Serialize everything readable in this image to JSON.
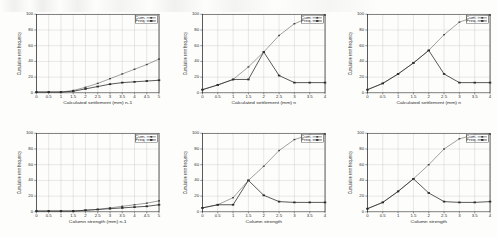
{
  "figure": {
    "background_color": "#fdfdfb",
    "ink_color": "#2b2b2b",
    "grid_color": "#b9b9b9",
    "rows": 2,
    "cols": 3
  },
  "chart_data": [
    {
      "type": "line",
      "panel": "top-left",
      "title": "",
      "xlabel": "Calculated settlement (mm) n-1",
      "ylabel": "Cumulative error frequency",
      "xlim": [
        0,
        5
      ],
      "ylim": [
        0,
        100
      ],
      "grid": true,
      "legend_position": "top-right",
      "xticks": [
        "0",
        "0.5",
        "1",
        "1.5",
        "2",
        "2.5",
        "3",
        "3.5",
        "4",
        "4.5",
        "5"
      ],
      "xtick_labels": [
        "0",
        "0.5",
        "1",
        "1.5",
        "2",
        "2.5",
        "3",
        "3.5",
        "4",
        "4.5",
        "5"
      ],
      "yticks": [
        0,
        20,
        40,
        60,
        80,
        100
      ],
      "ytick_labels": [
        "0",
        "20",
        "40",
        "60",
        "80",
        "100"
      ],
      "series": [
        {
          "name": "Cum.",
          "marker": "square",
          "x": [
            0,
            0.5,
            1,
            1.5,
            2,
            2.5,
            3,
            3.5,
            4,
            4.5,
            5
          ],
          "values": [
            1,
            1,
            1,
            3,
            7,
            12,
            18,
            24,
            30,
            36,
            43
          ]
        },
        {
          "name": "Freq.",
          "marker": "square",
          "x": [
            0,
            0.5,
            1,
            1.5,
            2,
            2.5,
            3,
            3.5,
            4,
            4.5,
            5
          ],
          "values": [
            1,
            1,
            1,
            2,
            5,
            8,
            11,
            13,
            14,
            15,
            16
          ]
        }
      ]
    },
    {
      "type": "line",
      "panel": "top-middle",
      "title": "",
      "xlabel": "Calculated settlement (mm) n",
      "ylabel": "Cumulative error frequency",
      "xlim": [
        0,
        4
      ],
      "ylim": [
        0,
        100
      ],
      "grid": true,
      "legend_position": "top-right",
      "xticks": [
        "0",
        "0.5",
        "1",
        "1.5",
        "2",
        "2.5",
        "3",
        "3.5",
        "4"
      ],
      "xtick_labels": [
        "0",
        "0.5",
        "1",
        "1.5",
        "2",
        "2.5",
        "3",
        "3.5",
        "4"
      ],
      "yticks": [
        0,
        20,
        40,
        60,
        80,
        100
      ],
      "ytick_labels": [
        "0",
        "20",
        "40",
        "60",
        "80",
        "100"
      ],
      "series": [
        {
          "name": "Cum.",
          "marker": "square",
          "x": [
            0,
            0.5,
            1,
            1.5,
            2,
            2.5,
            3,
            3.5,
            4
          ],
          "values": [
            4,
            10,
            17,
            33,
            52,
            73,
            88,
            96,
            99
          ]
        },
        {
          "name": "Freq.",
          "marker": "square",
          "x": [
            0,
            0.5,
            1,
            1.5,
            2,
            2.5,
            3,
            3.5,
            4
          ],
          "values": [
            4,
            10,
            17,
            17,
            52,
            22,
            13,
            13,
            13
          ]
        }
      ]
    },
    {
      "type": "line",
      "panel": "top-right",
      "title": "",
      "xlabel": "Calculated settlement (mm) n",
      "ylabel": "Cumulative error frequency",
      "xlim": [
        0,
        4
      ],
      "ylim": [
        0,
        100
      ],
      "grid": true,
      "legend_position": "top-right",
      "xticks": [
        "0",
        "0.5",
        "1",
        "1.5",
        "2",
        "2.5",
        "3",
        "3.5",
        "4"
      ],
      "xtick_labels": [
        "0",
        "0.5",
        "1",
        "1.5",
        "2",
        "2.5",
        "3",
        "3.5",
        "4"
      ],
      "yticks": [
        0,
        20,
        40,
        60,
        80,
        100
      ],
      "ytick_labels": [
        "0",
        "20",
        "40",
        "60",
        "80",
        "100"
      ],
      "series": [
        {
          "name": "Cum.",
          "marker": "square",
          "x": [
            0,
            0.5,
            1,
            1.5,
            2,
            2.5,
            3,
            3.5,
            4
          ],
          "values": [
            4,
            12,
            24,
            38,
            54,
            74,
            90,
            97,
            99
          ]
        },
        {
          "name": "Freq.",
          "marker": "square",
          "x": [
            0,
            0.5,
            1,
            1.5,
            2,
            2.5,
            3,
            3.5,
            4
          ],
          "values": [
            4,
            12,
            24,
            38,
            54,
            24,
            13,
            13,
            13
          ]
        }
      ]
    },
    {
      "type": "line",
      "panel": "bottom-left",
      "title": "",
      "xlabel": "Column strength (mm) n-1",
      "ylabel": "Cumulative error frequency",
      "xlim": [
        0,
        5
      ],
      "ylim": [
        0,
        100
      ],
      "grid": true,
      "legend_position": "top-right",
      "xticks": [
        "0",
        "0.5",
        "1",
        "1.5",
        "2",
        "2.5",
        "3",
        "3.5",
        "4",
        "4.5",
        "5"
      ],
      "xtick_labels": [
        "0",
        "0.5",
        "1",
        "1.5",
        "2",
        "2.5",
        "3",
        "3.5",
        "4",
        "4.5",
        "5"
      ],
      "yticks": [
        0,
        20,
        40,
        60,
        80,
        100
      ],
      "ytick_labels": [
        "0",
        "20",
        "40",
        "60",
        "80",
        "100"
      ],
      "series": [
        {
          "name": "Cum.",
          "marker": "square",
          "x": [
            0,
            0.5,
            1,
            1.5,
            2,
            2.5,
            3,
            3.5,
            4,
            4.5,
            5
          ],
          "values": [
            1,
            1,
            1,
            1,
            2,
            3,
            5,
            7,
            9,
            11,
            14
          ]
        },
        {
          "name": "Freq.",
          "marker": "square",
          "x": [
            0,
            0.5,
            1,
            1.5,
            2,
            2.5,
            3,
            3.5,
            4,
            4.5,
            5
          ],
          "values": [
            1,
            1,
            1,
            1,
            2,
            3,
            4,
            5,
            6,
            7,
            9
          ]
        }
      ]
    },
    {
      "type": "line",
      "panel": "bottom-middle",
      "title": "",
      "xlabel": "Column strength",
      "ylabel": "Cumulative error frequency",
      "xlim": [
        0,
        4
      ],
      "ylim": [
        0,
        100
      ],
      "grid": true,
      "legend_position": "top-right",
      "xticks": [
        "0",
        "0.5",
        "1",
        "1.5",
        "2",
        "2.5",
        "3",
        "3.5",
        "4"
      ],
      "xtick_labels": [
        "0",
        "0.5",
        "1",
        "1.5",
        "2",
        "2.5",
        "3",
        "3.5",
        "4"
      ],
      "yticks": [
        0,
        20,
        40,
        60,
        80,
        100
      ],
      "ytick_labels": [
        "0",
        "20",
        "40",
        "60",
        "80",
        "100"
      ],
      "series": [
        {
          "name": "Cum.",
          "marker": "square",
          "x": [
            0,
            0.5,
            1,
            1.5,
            2,
            2.5,
            3,
            3.5,
            4
          ],
          "values": [
            5,
            9,
            18,
            40,
            58,
            78,
            92,
            98,
            99
          ]
        },
        {
          "name": "Freq.",
          "marker": "square",
          "x": [
            0,
            0.5,
            1,
            1.5,
            2,
            2.5,
            3,
            3.5,
            4
          ],
          "values": [
            5,
            9,
            9,
            40,
            21,
            13,
            12,
            12,
            12
          ]
        }
      ]
    },
    {
      "type": "line",
      "panel": "bottom-right",
      "title": "",
      "xlabel": "Column strength",
      "ylabel": "Cumulative error frequency",
      "xlim": [
        0,
        4
      ],
      "ylim": [
        0,
        100
      ],
      "grid": true,
      "legend_position": "top-right",
      "xticks": [
        "0",
        "0.5",
        "1",
        "1.5",
        "2",
        "2.5",
        "3",
        "3.5",
        "4"
      ],
      "xtick_labels": [
        "0",
        "0.5",
        "1",
        "1.5",
        "2",
        "2.5",
        "3",
        "3.5",
        "4"
      ],
      "yticks": [
        0,
        20,
        40,
        60,
        80,
        100
      ],
      "ytick_labels": [
        "0",
        "20",
        "40",
        "60",
        "80",
        "100"
      ],
      "series": [
        {
          "name": "Cum.",
          "marker": "square",
          "x": [
            0,
            0.5,
            1,
            1.5,
            2,
            2.5,
            3,
            3.5,
            4
          ],
          "values": [
            4,
            12,
            26,
            42,
            60,
            80,
            93,
            98,
            99
          ]
        },
        {
          "name": "Freq.",
          "marker": "square",
          "x": [
            0,
            0.5,
            1,
            1.5,
            2,
            2.5,
            3,
            3.5,
            4
          ],
          "values": [
            4,
            12,
            26,
            42,
            24,
            13,
            12,
            12,
            13
          ]
        }
      ]
    }
  ]
}
